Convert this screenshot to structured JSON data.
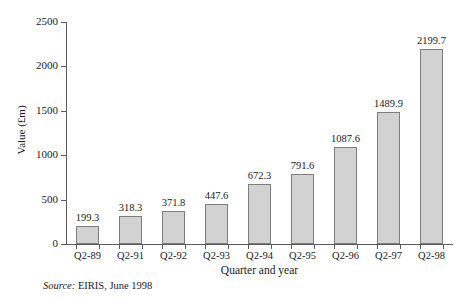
{
  "chart_data": {
    "type": "bar",
    "title": "",
    "subtitle": "",
    "xlabel": "Quarter and year",
    "ylabel": "Value (£m)",
    "categories": [
      "Q2-89",
      "Q2-91",
      "Q2-92",
      "Q2-93",
      "Q2-94",
      "Q2-95",
      "Q2-96",
      "Q2-97",
      "Q2-98"
    ],
    "values": [
      199.3,
      318.3,
      371.8,
      447.6,
      672.3,
      791.6,
      1087.6,
      1489.9,
      2199.7
    ],
    "value_labels": [
      "199.3",
      "318.3",
      "371.8",
      "447.6",
      "672.3",
      "791.6",
      "1087.6",
      "1489.9",
      "2199.7"
    ],
    "ylim": [
      0,
      2500
    ],
    "ytick_values": [
      0,
      500,
      1000,
      1500,
      2000,
      2500
    ],
    "ytick_labels": [
      "0",
      "500",
      "1000",
      "1500",
      "2000",
      "2500"
    ],
    "grid": false,
    "legend": null,
    "bar_color": "#d2d2d2",
    "bar_border_color": "#7d7d7d",
    "axis_color": "#5a5a5a"
  },
  "notes": {
    "source_prefix": "Source:",
    "source_text": "EIRIS, June 1998"
  }
}
